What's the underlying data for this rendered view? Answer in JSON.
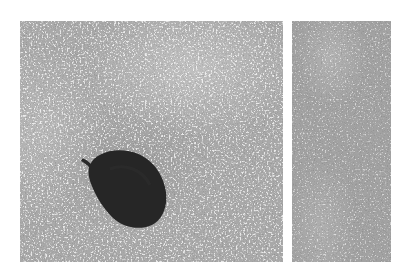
{
  "scene": {
    "description": "Two-panel grayscale photograph of a granular, speckled surface; the left panel shows a dark oval seed with a small stem lying on the surface",
    "background_color": "#ffffff",
    "panels": [
      {
        "id": "left",
        "base_color": "#a9a9a9",
        "speckle_color": "#e8e8e8"
      },
      {
        "id": "right",
        "base_color": "#a2a2a2",
        "speckle_color": "#d8d8d8"
      }
    ],
    "object": {
      "label": "dark seed",
      "color": "#262626",
      "stem_icon": "seed-stem"
    }
  }
}
